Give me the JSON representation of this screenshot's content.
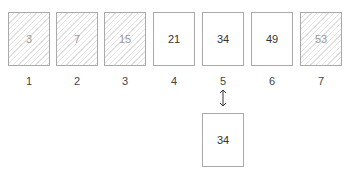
{
  "array": {
    "cells": [
      {
        "value": "3",
        "index": "1",
        "excluded": true
      },
      {
        "value": "7",
        "index": "2",
        "excluded": true
      },
      {
        "value": "15",
        "index": "3",
        "excluded": true
      },
      {
        "value": "21",
        "index": "4",
        "excluded": false
      },
      {
        "value": "34",
        "index": "5",
        "excluded": false
      },
      {
        "value": "49",
        "index": "6",
        "excluded": false
      },
      {
        "value": "53",
        "index": "7",
        "excluded": true
      }
    ]
  },
  "comparison": {
    "arrow_icon": "up-down-arrow-icon",
    "compared_index": "5",
    "target_value": "34"
  }
}
